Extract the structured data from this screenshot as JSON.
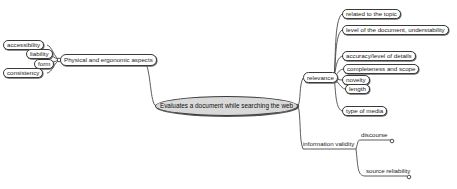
{
  "diagram": {
    "type": "mind-map",
    "central_topic": "Evaluates a document while searching the web",
    "colors": {
      "central_fill": "#d9d9d9",
      "border": "#3a3a3a",
      "line": "#4a4a4a",
      "background": "#ffffff"
    },
    "branches": {
      "physical": {
        "label": "Physical and ergonomic aspects",
        "children": [
          "accessibility",
          "liability",
          "form",
          "consistency"
        ]
      },
      "relevance": {
        "label": "relevance",
        "children": [
          "related to the topic",
          "level of the document, understability",
          "accuracy/level of details",
          "completeness and scope",
          "novelty",
          "length",
          "type of media"
        ]
      },
      "validity": {
        "label": "information validity",
        "children": [
          "discourse",
          "source reliability"
        ]
      }
    }
  }
}
